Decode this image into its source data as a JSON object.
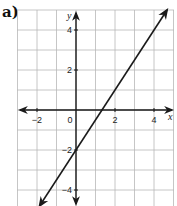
{
  "panel_label": "a)",
  "chart_data": {
    "type": "line",
    "title": "",
    "xlabel": "x",
    "ylabel": "y",
    "xlim": [
      -3,
      5
    ],
    "ylim": [
      -4.8,
      5
    ],
    "grid": true,
    "x_ticks": [
      -2,
      0,
      2,
      4
    ],
    "y_ticks": [
      4,
      2,
      -2,
      -4
    ],
    "x_tick_labels": [
      "−2",
      "0",
      "2",
      "4"
    ],
    "y_tick_labels": [
      "4",
      "2",
      "−2",
      "−4"
    ],
    "series": [
      {
        "name": "line",
        "equation": "y = 1.5x − 2",
        "x": [
          -1.87,
          0,
          1.33,
          4.67
        ],
        "y": [
          -4.8,
          -2,
          0,
          5
        ],
        "arrows_both_ends": true,
        "color": "#1a1a1a"
      }
    ],
    "colors": {
      "grid": "#b8b8b8",
      "axis": "#1a1a1a",
      "line": "#1a1a1a"
    }
  }
}
